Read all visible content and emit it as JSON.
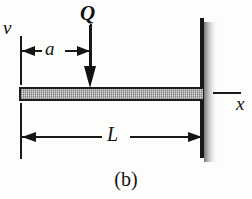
{
  "figure": {
    "caption": "(b)",
    "type": "cantilever-beam-free-body-diagram"
  },
  "labels": {
    "vertical_axis": "v",
    "horizontal_axis": "x",
    "load": "Q",
    "distance_to_load": "a",
    "beam_length": "L"
  },
  "icons": {
    "load_arrow": "downward-force-arrow-icon",
    "dimension_a": "double-headed-dimension-arrow-icon",
    "dimension_L": "double-headed-dimension-arrow-icon",
    "wall": "fixed-support-wall-icon",
    "beam": "hatched-beam-icon"
  },
  "colors": {
    "ink": "#1a1a1a",
    "beam_fill": "#bdbdbd",
    "background": "#fdfdfc",
    "shadow": "#707070"
  }
}
